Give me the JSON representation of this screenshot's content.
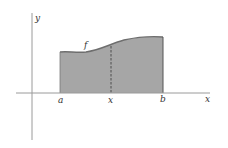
{
  "diagram": {
    "axes": {
      "x_label": "x",
      "y_label": "y"
    },
    "function_label": "f",
    "interval": {
      "start_label": "a",
      "variable_label": "x",
      "end_label": "b"
    },
    "colors": {
      "fill": "#a6a6a6",
      "curve": "#6e6e6e",
      "axis": "#9a9a9a",
      "dashed": "#444444",
      "label": "#333333"
    }
  }
}
